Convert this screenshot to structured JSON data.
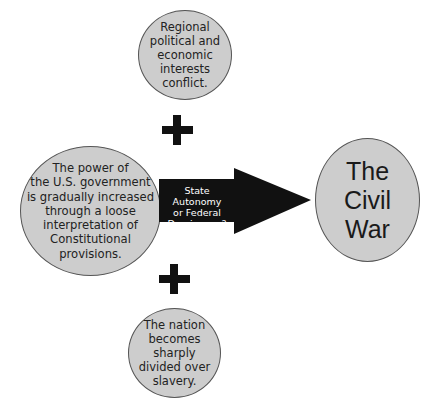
{
  "diagram": {
    "causes": {
      "top": "Regional\npolitical and\neconomic\ninterests\nconflict.",
      "left": "The power of\nthe U.S. government\nis gradually increased\nthrough a loose\ninterpretation of\nConstitutional\nprovisions.",
      "bottom": "The nation\nbecomes\nsharply\ndivided over\nslavery."
    },
    "arrow_label": "State Autonomy\nor Federal\nDominance?",
    "result": "The\nCivil\nWar",
    "connector_symbol": "plus",
    "colors": {
      "circle_fill": "#cdcdcd",
      "circle_border": "#555555",
      "arrow": "#111111",
      "plus": "#111111"
    }
  }
}
